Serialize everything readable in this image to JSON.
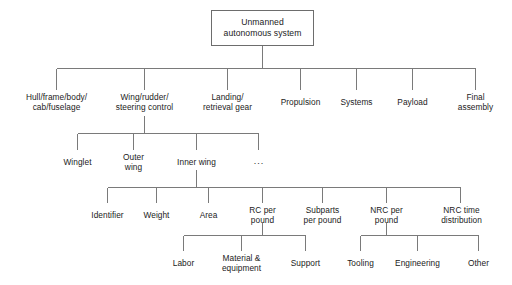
{
  "diagram": {
    "type": "tree",
    "line_color": "#7a7a7a",
    "text_color": "#1b1b1b",
    "background": "#ffffff",
    "root": {
      "label": "Unmanned\nautonomous system"
    },
    "level2": [
      {
        "label": "Hull/frame/body/\ncab/fuselage"
      },
      {
        "label": "Wing/rudder/\nsteering control"
      },
      {
        "label": "Landing/\nretrieval gear"
      },
      {
        "label": "Propulsion"
      },
      {
        "label": "Systems"
      },
      {
        "label": "Payload"
      },
      {
        "label": "Final\nassembly"
      }
    ],
    "level3": [
      {
        "label": "Winglet"
      },
      {
        "label": "Outer\nwing"
      },
      {
        "label": "Inner wing"
      },
      {
        "label": "..."
      }
    ],
    "level4": [
      {
        "label": "Identifier"
      },
      {
        "label": "Weight"
      },
      {
        "label": "Area"
      },
      {
        "label": "RC per\npound"
      },
      {
        "label": "Subparts\nper pound"
      },
      {
        "label": "NRC per\npound"
      },
      {
        "label": "NRC time\ndistribution"
      }
    ],
    "level5_left": [
      {
        "label": "Labor"
      },
      {
        "label": "Material &\nequipment"
      },
      {
        "label": "Support"
      }
    ],
    "level5_right": [
      {
        "label": "Tooling"
      },
      {
        "label": "Engineering"
      },
      {
        "label": "Other"
      }
    ]
  }
}
